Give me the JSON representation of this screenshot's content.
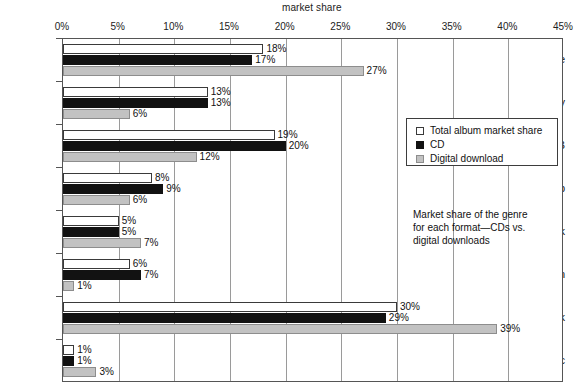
{
  "chart_data": {
    "type": "bar",
    "orientation": "horizontal",
    "title": "market share",
    "xlabel": "",
    "ylabel": "",
    "xlim": [
      0,
      45
    ],
    "xtick_labels": [
      "0%",
      "5%",
      "10%",
      "15%",
      "20%",
      "25%",
      "30%",
      "35%",
      "40%",
      "45%"
    ],
    "xtick_values": [
      0,
      5,
      10,
      15,
      20,
      25,
      30,
      35,
      40,
      45
    ],
    "grid": true,
    "value_suffix": "%",
    "categories": [
      "Alternative",
      "Country",
      "R&B",
      "Rap",
      "Soundtrack",
      "Latin",
      "Rock",
      "Electronic"
    ],
    "series": [
      {
        "name": "Total album market share",
        "key": "total",
        "color": "#ffffff",
        "edge_color": "#3a3a3a",
        "values": [
          18,
          13,
          19,
          8,
          5,
          6,
          30,
          1
        ],
        "labels": [
          "18%",
          "13%",
          "19%",
          "8%",
          "5%",
          "6%",
          "30%",
          "1%"
        ]
      },
      {
        "name": "CD",
        "key": "cd",
        "color": "#121212",
        "edge_color": "#121212",
        "values": [
          17,
          13,
          20,
          9,
          5,
          7,
          29,
          1
        ],
        "labels": [
          "17%",
          "13%",
          "20%",
          "9%",
          "5%",
          "7%",
          "29%",
          "1%"
        ]
      },
      {
        "name": "Digital download",
        "key": "dd",
        "color": "#c2c2c2",
        "edge_color": "#8d8d8d",
        "values": [
          27,
          6,
          12,
          6,
          7,
          1,
          39,
          3
        ],
        "labels": [
          "27%",
          "6%",
          "12%",
          "6%",
          "7%",
          "1%",
          "39%",
          "3%"
        ]
      }
    ],
    "legend": {
      "position": "center-right",
      "entries": [
        {
          "label": "Total album market share",
          "key": "total"
        },
        {
          "label": "CD",
          "key": "cd"
        },
        {
          "label": "Digital download",
          "key": "dd"
        }
      ]
    },
    "annotations": [
      {
        "text": "Market share of the genre for each format—CDs vs. digital downloads",
        "lines": [
          "Market share of the genre",
          "for each format—CDs vs.",
          "digital downloads"
        ]
      }
    ]
  }
}
